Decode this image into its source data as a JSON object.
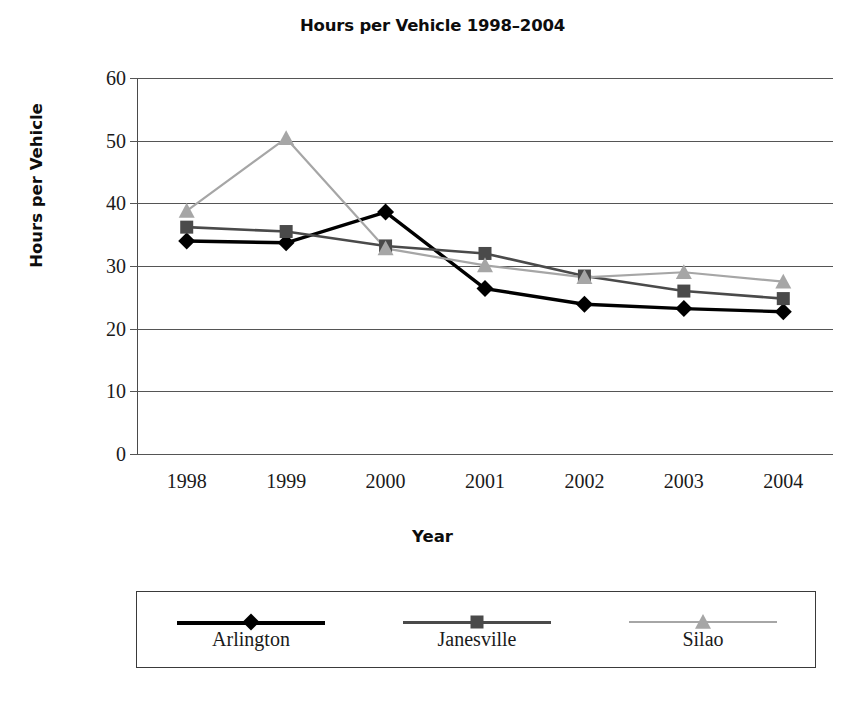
{
  "chart_data": {
    "type": "line",
    "title": "Hours per Vehicle 1998–2004",
    "xlabel": "Year",
    "ylabel": "Hours per Vehicle",
    "categories": [
      "1998",
      "1999",
      "2000",
      "2001",
      "2002",
      "2003",
      "2004"
    ],
    "ylim": [
      0,
      60
    ],
    "ytick_labels": [
      "0",
      "10",
      "20",
      "30",
      "40",
      "50",
      "60"
    ],
    "ytick_values": [
      0,
      10,
      20,
      30,
      40,
      50,
      60
    ],
    "grid": true,
    "legend_position": "bottom",
    "series": [
      {
        "name": "Arlington",
        "marker": "diamond",
        "color": "#000000",
        "values": [
          34.0,
          33.7,
          38.6,
          26.4,
          23.9,
          23.2,
          22.7
        ]
      },
      {
        "name": "Janesville",
        "marker": "square",
        "color": "#4a4a4a",
        "values": [
          36.2,
          35.5,
          33.2,
          32.0,
          28.4,
          26.0,
          24.8
        ]
      },
      {
        "name": "Silao",
        "marker": "triangle",
        "color": "#a6a6a6",
        "values": [
          38.8,
          50.4,
          32.8,
          30.1,
          28.2,
          29.0,
          27.5
        ]
      }
    ]
  },
  "colors": {
    "arlington": "#000000",
    "janesville": "#4a4a4a",
    "silao": "#a6a6a6",
    "grid": "#555555",
    "axis": "#4a4a4a",
    "text": "#1a1a1a",
    "background": "#ffffff"
  }
}
